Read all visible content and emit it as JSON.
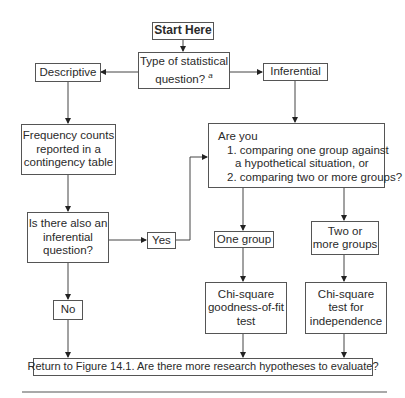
{
  "flowchart": {
    "start": "Start Here",
    "question_type": {
      "text": "Type of statistical question?",
      "footnote": "a"
    },
    "descriptive": "Descriptive",
    "inferential": "Inferential",
    "frequency": [
      "Frequency counts",
      "reported in a",
      "contingency table"
    ],
    "also_inferential": [
      "Is there also an",
      "inferential",
      "question?"
    ],
    "yes": "Yes",
    "no": "No",
    "are_you": {
      "heading": "Are you",
      "option1_line1": "1. comparing one group against",
      "option1_line2": "a hypothetical situation, or",
      "option2": "2. comparing two or more groups?"
    },
    "one_group": "One group",
    "two_groups": [
      "Two or",
      "more groups"
    ],
    "goodness_of_fit": [
      "Chi-square",
      "goodness-of-fit",
      "test"
    ],
    "independence": [
      "Chi-square",
      "test for",
      "independence"
    ],
    "return": "Return to Figure 14.1. Are there more research hypotheses to evaluate?"
  }
}
